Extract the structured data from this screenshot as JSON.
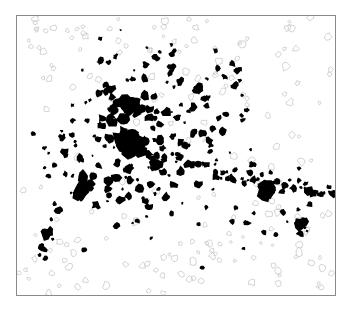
{
  "map": {
    "frame": {
      "x": 16,
      "y": 15,
      "width": 320,
      "height": 281,
      "border_color": "#8a8a8a"
    },
    "colors": {
      "settlement": "#000000",
      "faint_outline": "#c8c8c8",
      "background": "#ffffff"
    },
    "description": "Binary settlement/built-up area pattern: dense core cluster left of center with corridors radiating east and west, sparse faint outlines at periphery",
    "core_clusters": [
      {
        "cx": 130,
        "cy": 145,
        "r": 14
      },
      {
        "cx": 128,
        "cy": 105,
        "r": 9
      },
      {
        "cx": 82,
        "cy": 190,
        "r": 8
      },
      {
        "cx": 45,
        "cy": 232,
        "r": 6
      },
      {
        "cx": 266,
        "cy": 188,
        "r": 8
      },
      {
        "cx": 300,
        "cy": 222,
        "r": 6
      },
      {
        "cx": 196,
        "cy": 88,
        "r": 5
      },
      {
        "cx": 237,
        "cy": 70,
        "r": 4
      },
      {
        "cx": 222,
        "cy": 130,
        "r": 4
      },
      {
        "cx": 155,
        "cy": 165,
        "r": 6
      }
    ]
  }
}
